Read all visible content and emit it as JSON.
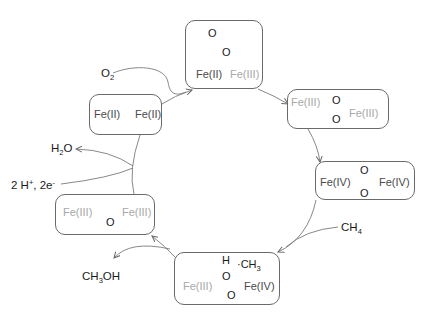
{
  "diagram": {
    "colors": {
      "dark_text": "#4a4a4a",
      "light_text": "#a8a8a8",
      "line": "#6a6a6a"
    },
    "states": [
      {
        "id": "diferrous",
        "left": "Fe(II)",
        "right": "Fe(II)"
      },
      {
        "id": "superoxo",
        "top_o": "O",
        "mid_o": "O",
        "left": "Fe(II)",
        "right": "Fe(III)"
      },
      {
        "id": "peroxo",
        "left": "Fe(III)",
        "o_top": "O",
        "o_bottom": "O",
        "right": "Fe(III)"
      },
      {
        "id": "compound_q",
        "left": "Fe(IV)",
        "o_top": "O",
        "o_bottom": "O",
        "right": "Fe(IV)"
      },
      {
        "id": "hydroxo_radical",
        "h": "H",
        "o_top": "O",
        "radical": "·CH",
        "radical_sub": "3",
        "left": "Fe(III)",
        "right": "Fe(IV)",
        "o_bottom": "O"
      },
      {
        "id": "oxo_bridged",
        "left": "Fe(III)",
        "o": "O",
        "right": "Fe(III)"
      }
    ],
    "reagents": {
      "o2": {
        "main": "O",
        "sub": "2"
      },
      "h2o": {
        "a": "H",
        "sub": "2",
        "b": "O"
      },
      "protons": {
        "a": "2 H",
        "sup1": "+",
        "b": ", 2e",
        "sup2": "-"
      },
      "ch4": {
        "main": "CH",
        "sub": "4"
      },
      "ch3oh": {
        "a": "CH",
        "sub": "3",
        "b": "OH"
      }
    }
  }
}
